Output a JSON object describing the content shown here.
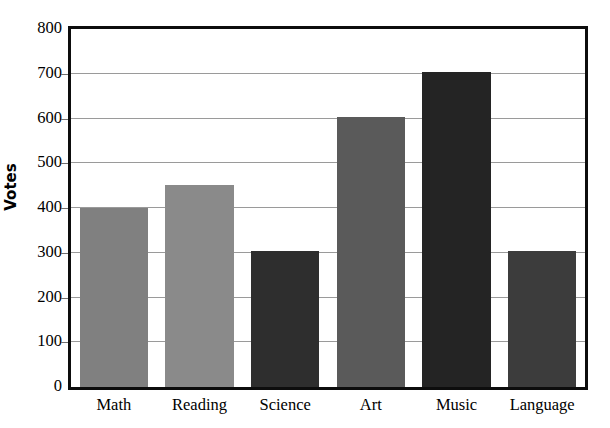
{
  "chart_data": {
    "type": "bar",
    "title": "",
    "xlabel": "",
    "ylabel": "Votes",
    "categories": [
      "Math",
      "Reading",
      "Science",
      "Art",
      "Music",
      "Language"
    ],
    "values": [
      400,
      452,
      303,
      603,
      703,
      303
    ],
    "bar_colors": [
      "#808080",
      "#8a8a8a",
      "#2e2e2e",
      "#5a5a5a",
      "#242424",
      "#3c3c3c"
    ],
    "ylim": [
      0,
      800
    ],
    "ytick_values": [
      0,
      100,
      200,
      300,
      400,
      500,
      600,
      700,
      800
    ],
    "ytick_labels": [
      "0",
      "100",
      "200",
      "300",
      "400",
      "500",
      "600",
      "700",
      "800"
    ],
    "grid": true,
    "grid_axis": "y",
    "legend": false,
    "legend_position": "none",
    "axis_frame_color": "#0d0d0d",
    "gridline_color": "#9a9a9a",
    "background_color": "#ffffff",
    "series": [
      {
        "name": "Votes",
        "values": [
          400,
          452,
          303,
          603,
          703,
          303
        ]
      }
    ]
  }
}
